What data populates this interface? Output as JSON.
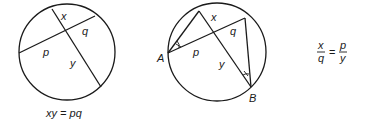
{
  "figure_left": {
    "labels": {
      "x": "x",
      "q": "q",
      "p": "p",
      "y": "y"
    },
    "caption": "xy = pq"
  },
  "figure_right": {
    "labels": {
      "x": "x",
      "q": "q",
      "p": "p",
      "y": "y",
      "A": "A",
      "B": "B"
    }
  },
  "formula": {
    "left_num": "x",
    "left_den": "q",
    "equals": "=",
    "right_num": "p",
    "right_den": "y"
  },
  "colors": {
    "stroke": "#1a1a1a",
    "background": "#ffffff"
  }
}
